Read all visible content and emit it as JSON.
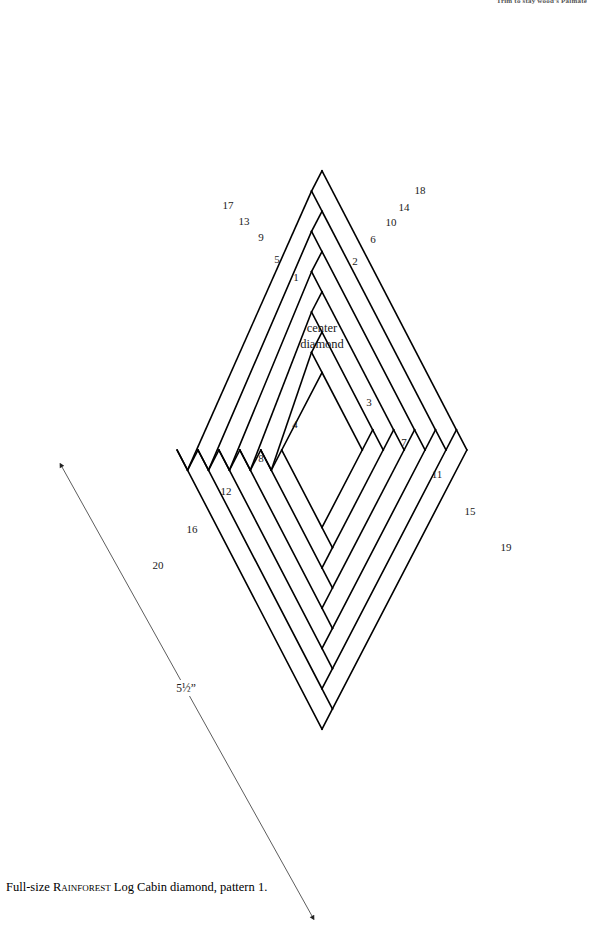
{
  "page": {
    "width": 595,
    "height": 926,
    "background": "#ffffff",
    "ink": "#000000"
  },
  "running_header": {
    "text": "Trim to stay wood's Palmate",
    "visible": "partially-cropped-at-top-edge"
  },
  "caption": {
    "prefix": "Full-size ",
    "smallcaps": "Rainforest",
    "suffix": " Log Cabin diamond, pattern 1."
  },
  "diagram": {
    "center_label_line1": "center",
    "center_label_line2": "diamond",
    "stroke_color": "#000000",
    "stroke_width": 1.6,
    "fill": "none",
    "geometry": {
      "apex_top": [
        322,
        5
      ],
      "vertex_left": [
        92,
        450
      ],
      "vertex_right": [
        552,
        455
      ],
      "vertex_bottom": [
        333,
        890
      ],
      "center": [
        322,
        450
      ],
      "half_width": 230,
      "half_height": 443,
      "strip_count": 20,
      "strip_step": 0.091,
      "center_diamond_scale": 0.175
    },
    "strips": [
      {
        "n": "1",
        "label_x": 296,
        "label_y": 281
      },
      {
        "n": "2",
        "label_x": 355,
        "label_y": 265
      },
      {
        "n": "3",
        "label_x": 369,
        "label_y": 406
      },
      {
        "n": "4",
        "label_x": 295,
        "label_y": 428
      },
      {
        "n": "5",
        "label_x": 277,
        "label_y": 263
      },
      {
        "n": "6",
        "label_x": 373,
        "label_y": 243
      },
      {
        "n": "7",
        "label_x": 404,
        "label_y": 446
      },
      {
        "n": "8",
        "label_x": 261,
        "label_y": 462
      },
      {
        "n": "9",
        "label_x": 261,
        "label_y": 241
      },
      {
        "n": "10",
        "label_x": 391,
        "label_y": 226
      },
      {
        "n": "11",
        "label_x": 437,
        "label_y": 478
      },
      {
        "n": "12",
        "label_x": 226,
        "label_y": 495
      },
      {
        "n": "13",
        "label_x": 244,
        "label_y": 225
      },
      {
        "n": "14",
        "label_x": 404,
        "label_y": 211
      },
      {
        "n": "15",
        "label_x": 470,
        "label_y": 515
      },
      {
        "n": "16",
        "label_x": 192,
        "label_y": 533
      },
      {
        "n": "17",
        "label_x": 228,
        "label_y": 209
      },
      {
        "n": "18",
        "label_x": 420,
        "label_y": 194
      },
      {
        "n": "19",
        "label_x": 506,
        "label_y": 551
      },
      {
        "n": "20",
        "label_x": 158,
        "label_y": 569
      }
    ],
    "dimension": {
      "label": "5½”",
      "label_x": 186,
      "label_y": 692,
      "arrow_start": [
        62,
        467
      ],
      "arrow_end": [
        312,
        916
      ],
      "arrow_color": "#333333",
      "arrow_width": 0.8
    }
  }
}
